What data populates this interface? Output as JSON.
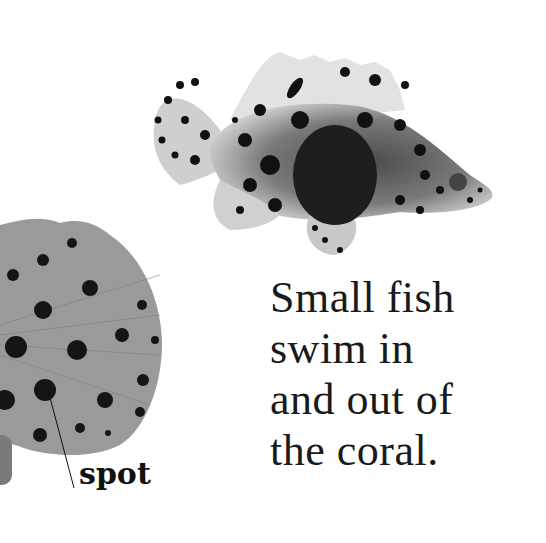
{
  "page": {
    "text_lines": [
      "Small fish",
      "swim in",
      "and out of",
      "the coral."
    ],
    "label": "spot"
  },
  "images": {
    "main": "spotted-fish-photo",
    "closeup": "spotted-fin-closeup"
  },
  "colors": {
    "background": "#ffffff",
    "text": "#1a1a1a",
    "spot": "#111111",
    "fin": "#9a9a9a"
  }
}
